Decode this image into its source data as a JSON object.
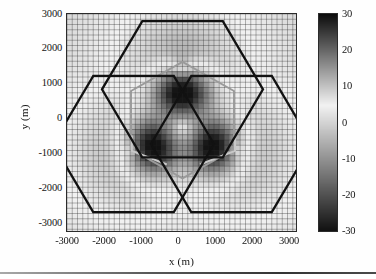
{
  "figure": {
    "title": "",
    "background": "#ffffff"
  },
  "axes": {
    "xlabel": "x (m)",
    "ylabel": "y (m)",
    "xticks": [
      "-3000",
      "-2000",
      "-1000",
      "0",
      "1000",
      "2000",
      "3000"
    ],
    "yticks": [
      "3000",
      "2000",
      "1000",
      "0",
      "-1000",
      "-2000",
      "-3000"
    ]
  },
  "colorbar": {
    "ticks": [
      "30",
      "20",
      "10",
      "0",
      "-10",
      "-20",
      "-30"
    ],
    "min": -30,
    "max": 30,
    "colormap": "diverging-gray",
    "dark_color": "#111111",
    "light_color": "#f2f2f2"
  },
  "chart_data": {
    "type": "heatmap",
    "title": "",
    "xlabel": "x (m)",
    "ylabel": "y (m)",
    "xlim": [
      -3300,
      3300
    ],
    "ylim": [
      -3200,
      3200
    ],
    "zlim": [
      -30,
      30
    ],
    "zlabel": "",
    "grid": true,
    "grid_spacing": 150,
    "grid_color": "#3a3a3a",
    "legend": "none",
    "colorbar_position": "right",
    "xticks": [
      -3000,
      -2000,
      -1000,
      0,
      1000,
      2000,
      3000
    ],
    "yticks": [
      -3000,
      -2000,
      -1000,
      0,
      1000,
      2000,
      3000
    ],
    "cticks": [
      -30,
      -20,
      -10,
      0,
      10,
      20,
      30
    ],
    "sources": [
      {
        "name": "bs-top",
        "x": 0,
        "y": 1700,
        "peak": 30
      },
      {
        "name": "bs-center",
        "x": 0,
        "y": -100,
        "peak": 30
      },
      {
        "name": "bs-left",
        "x": -1450,
        "y": -800,
        "peak": 30
      },
      {
        "name": "bs-right",
        "x": 1500,
        "y": -800,
        "peak": 30
      }
    ],
    "nulls": [
      {
        "name": "null-left",
        "x": -900,
        "y": -700,
        "value": -30
      },
      {
        "name": "null-right",
        "x": 950,
        "y": -700,
        "value": -30
      },
      {
        "name": "null-upper",
        "x": 0,
        "y": 900,
        "value": -28
      }
    ],
    "background_level": 6,
    "cells": [
      {
        "name": "cell-top",
        "center_x": 0,
        "center_y": 1000,
        "radius": 2300,
        "orientation": "flat-left",
        "color": "#111111"
      },
      {
        "name": "cell-left",
        "center_x": -1400,
        "center_y": -600,
        "radius": 2300,
        "orientation": "flat-left",
        "color": "#111111"
      },
      {
        "name": "cell-right",
        "center_x": 1400,
        "center_y": -600,
        "radius": 2300,
        "orientation": "flat-left",
        "color": "#111111"
      }
    ],
    "inner_region": {
      "name": "coverage-hexagon",
      "center_x": 0,
      "center_y": 100,
      "radius": 1700,
      "orientation": "pointy-left",
      "color": "#9a9a9a"
    },
    "markers": [
      {
        "name": "antenna-arm-left",
        "points": [
          [
            -1450,
            -350
          ],
          [
            -1450,
            -800
          ],
          [
            -450,
            -1200
          ]
        ],
        "color": "#c8c8c8"
      },
      {
        "name": "antenna-arm-right",
        "points": [
          [
            1500,
            -350
          ],
          [
            1500,
            -800
          ],
          [
            500,
            -1200
          ]
        ],
        "color": "#c8c8c8"
      }
    ]
  }
}
